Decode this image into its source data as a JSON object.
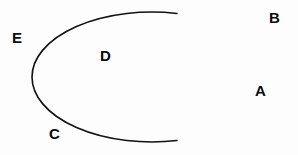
{
  "figure": {
    "background_color": "#fdfdfd",
    "stroke_color": "#111111",
    "stroke_width": 1.6,
    "ellipse": {
      "center_x": 152,
      "center_y": 77,
      "radius_x": 120,
      "radius_y": 65,
      "gap_side": "right",
      "arc_start_deg": -78,
      "arc_end_deg": 78,
      "open": true
    },
    "labels": [
      {
        "id": "A",
        "text": "A",
        "position": "gap-right",
        "inside": false,
        "x": 255,
        "y": 83
      },
      {
        "id": "B",
        "text": "B",
        "position": "outside-upper-right",
        "inside": false,
        "x": 269,
        "y": 10
      },
      {
        "id": "C",
        "text": "C",
        "position": "outside-lower-left",
        "inside": false,
        "x": 49,
        "y": 126
      },
      {
        "id": "D",
        "text": "D",
        "position": "interior",
        "inside": true,
        "x": 100,
        "y": 48
      },
      {
        "id": "E",
        "text": "E",
        "position": "outside-upper-left",
        "inside": false,
        "x": 12,
        "y": 30
      }
    ]
  }
}
